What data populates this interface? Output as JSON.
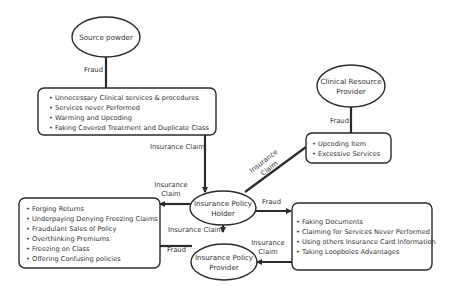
{
  "nodes": {
    "source_powder": {
      "label": "Source powder"
    },
    "clinical_resource_provider": {
      "label_line1": "Clinical Resource",
      "label_line2": "Provider"
    },
    "insurance_policy_holder": {
      "label_line1": "Insurance Policy",
      "label_line2": "Holder"
    },
    "insurance_policy_provider": {
      "label_line1": "Insurance Policy",
      "label_line2": "Provider"
    }
  },
  "boxes": {
    "source_frauds": {
      "items": [
        "• Unnecessary Clinical services & procedures",
        "• Services never Performed",
        "• Warming and Upcoding",
        "• Faking Covered Treatment and Duplicate Class"
      ]
    },
    "clinical_frauds": {
      "items": [
        "• Upcoding Item",
        "• Excessive Services"
      ]
    },
    "provider_frauds": {
      "items": [
        "• Forging Returns",
        "• Underpaying Denying Freezing Claims",
        "• Fraudulant Sales of Policy",
        "• Overthinking Premiums",
        "• Freezing on Class",
        "• Offering Confusing policies"
      ]
    },
    "holder_frauds": {
      "items": [
        "• Faking Documents",
        "• Claiming for Services Never Performed",
        "• Using others Insurance Card Information",
        "• Taking Loopboles Advantages"
      ]
    }
  },
  "edge_labels": {
    "source_fraud": "Fraud",
    "clinical_fraud": "Fraud",
    "source_claim": "Insurance Claim",
    "clinical_claim_line1": "Insurance",
    "clinical_claim_line2": "Claim",
    "left_claim_line1": "Insurance",
    "left_claim_line2": "Claim",
    "holder_to_provider": "Insurance Claim",
    "left_fraud": "Fraud",
    "holder_fraud": "Fraud",
    "right_claim_line1": "Insurance",
    "right_claim_line2": "Claim"
  }
}
